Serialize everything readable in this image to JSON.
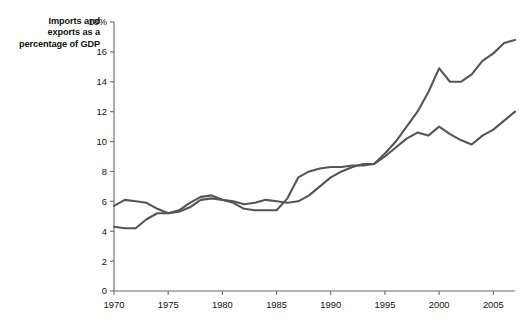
{
  "chart_data": {
    "type": "line",
    "title": "Imports and exports as a percentage of GDP",
    "xlabel": "",
    "ylabel": "",
    "xlim": [
      1970,
      2007
    ],
    "ylim": [
      0,
      18
    ],
    "grid": false,
    "legend": "none",
    "y_ticks": [
      "0",
      "2",
      "4",
      "6",
      "8",
      "10",
      "12",
      "14",
      "16",
      "18%"
    ],
    "y_tick_values": [
      0,
      2,
      4,
      6,
      8,
      10,
      12,
      14,
      16,
      18
    ],
    "x_ticks": [
      "1970",
      "1975",
      "1980",
      "1985",
      "1990",
      "1995",
      "2000",
      "2005"
    ],
    "x_tick_values": [
      1970,
      1975,
      1980,
      1985,
      1990,
      1995,
      2000,
      2005
    ],
    "line_color": "#555555",
    "axis_color": "#6a6a6a",
    "x": [
      1970,
      1971,
      1972,
      1973,
      1974,
      1975,
      1976,
      1977,
      1978,
      1979,
      1980,
      1981,
      1982,
      1983,
      1984,
      1985,
      1986,
      1987,
      1988,
      1989,
      1990,
      1991,
      1992,
      1993,
      1994,
      1995,
      1996,
      1997,
      1998,
      1999,
      2000,
      2001,
      2002,
      2003,
      2004,
      2005,
      2006,
      2007
    ],
    "series": [
      {
        "name": "Imports",
        "values": [
          5.7,
          6.1,
          6.0,
          5.9,
          5.5,
          5.2,
          5.3,
          5.6,
          6.1,
          6.2,
          6.1,
          5.9,
          5.5,
          5.4,
          5.4,
          5.4,
          6.2,
          7.6,
          8.0,
          8.2,
          8.3,
          8.3,
          8.4,
          8.4,
          8.5,
          9.2,
          10.0,
          11.0,
          12.0,
          13.3,
          14.9,
          14.0,
          14.0,
          14.5,
          15.4,
          15.9,
          16.6,
          16.8
        ]
      },
      {
        "name": "Exports",
        "values": [
          4.3,
          4.2,
          4.2,
          4.8,
          5.2,
          5.2,
          5.4,
          5.9,
          6.3,
          6.4,
          6.1,
          6.0,
          5.8,
          5.9,
          6.1,
          6.0,
          5.9,
          6.0,
          6.4,
          7.0,
          7.6,
          8.0,
          8.3,
          8.5,
          8.5,
          9.0,
          9.6,
          10.2,
          10.6,
          10.4,
          11.0,
          10.5,
          10.1,
          9.8,
          10.4,
          10.8,
          11.4,
          12.0
        ]
      }
    ]
  }
}
